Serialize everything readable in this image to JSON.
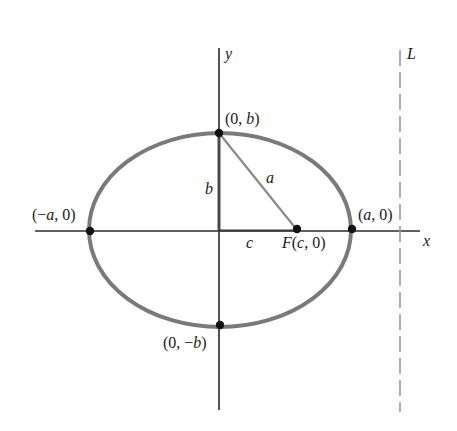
{
  "diagram": {
    "type": "ellipse-with-focus-and-directrix",
    "colors": {
      "axis": "#2a2a2a",
      "ellipse": "#7a7a7a",
      "segment": "#8a8a8a",
      "b_segment": "#4a4a4a",
      "directrix": "#9a9a9a",
      "points": "#111111"
    },
    "axes": {
      "x_label": "x",
      "y_label": "y"
    },
    "directrix_label": "L",
    "points": {
      "top": {
        "label_open": "(0, ",
        "label_var": "b",
        "label_close": ")"
      },
      "bottom": {
        "label_open": "(0, −",
        "label_var": "b",
        "label_close": ")"
      },
      "left": {
        "label_open": "(−",
        "label_var": "a",
        "label_close": ", 0)"
      },
      "right": {
        "label_open": "(",
        "label_var": "a",
        "label_close": ", 0)"
      },
      "focus": {
        "label_name": "F",
        "label_open": "(",
        "label_var": "c",
        "label_close": ", 0)"
      }
    },
    "segment_labels": {
      "a": "a",
      "b": "b",
      "c": "c"
    }
  }
}
